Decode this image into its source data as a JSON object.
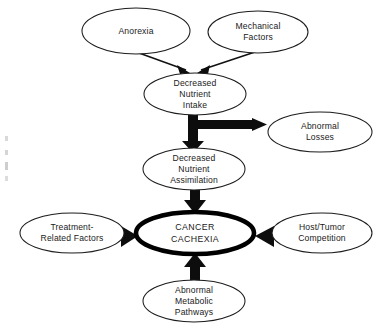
{
  "diagram": {
    "type": "flow-diagram",
    "background_color": "#ffffff",
    "line_color": "#111111",
    "text_color": "#1a1a1a",
    "nodes": [
      {
        "id": "anorexia",
        "lines": [
          "Anorexia"
        ],
        "shape": "ellipse",
        "emphasis": "normal",
        "cx": 136,
        "cy": 31,
        "rx": 54,
        "ry": 23
      },
      {
        "id": "mechanical-factors",
        "lines": [
          "Mechanical",
          "Factors"
        ],
        "shape": "ellipse",
        "emphasis": "normal",
        "cx": 258,
        "cy": 32,
        "rx": 50,
        "ry": 21
      },
      {
        "id": "decreased-nutrient-intake",
        "lines": [
          "Decreased",
          "Nutrient",
          "Intake"
        ],
        "shape": "ellipse",
        "emphasis": "normal",
        "cx": 195,
        "cy": 94,
        "rx": 51,
        "ry": 21
      },
      {
        "id": "abnormal-losses",
        "lines": [
          "Abnormal",
          "Losses"
        ],
        "shape": "ellipse",
        "emphasis": "normal",
        "cx": 320,
        "cy": 132,
        "rx": 52,
        "ry": 20
      },
      {
        "id": "decreased-nutrient-assimilation",
        "lines": [
          "Decreased",
          "Nutrient",
          "Assimilation"
        ],
        "shape": "ellipse",
        "emphasis": "normal",
        "cx": 194,
        "cy": 169,
        "rx": 51,
        "ry": 21
      },
      {
        "id": "treatment-related-factors",
        "lines": [
          "Treatment-",
          "Related Factors"
        ],
        "shape": "ellipse",
        "emphasis": "normal",
        "cx": 72,
        "cy": 233,
        "rx": 52,
        "ry": 20
      },
      {
        "id": "cancer-cachexia",
        "lines": [
          "CANCER",
          "CACHEXIA"
        ],
        "shape": "ellipse",
        "emphasis": "bold",
        "cx": 195,
        "cy": 233,
        "rx": 59,
        "ry": 21
      },
      {
        "id": "host-tumor-competition",
        "lines": [
          "Host/Tumor",
          "Competition"
        ],
        "shape": "ellipse",
        "emphasis": "normal",
        "cx": 322,
        "cy": 233,
        "rx": 50,
        "ry": 20
      },
      {
        "id": "abnormal-metabolic-pathways",
        "lines": [
          "Abnormal",
          "Metabolic",
          "Pathways"
        ],
        "shape": "ellipse",
        "emphasis": "normal",
        "cx": 194,
        "cy": 301,
        "rx": 51,
        "ry": 21
      }
    ],
    "edges": [
      {
        "id": "anorexia-to-intake",
        "from": "anorexia",
        "to": "decreased-nutrient-intake",
        "style": "thin"
      },
      {
        "id": "mechanical-to-intake",
        "from": "mechanical-factors",
        "to": "decreased-nutrient-intake",
        "style": "thin"
      },
      {
        "id": "intake-to-assimilation",
        "from": "decreased-nutrient-intake",
        "to": "decreased-nutrient-assimilation",
        "style": "thick"
      },
      {
        "id": "intake-to-abnormal-losses",
        "from": "decreased-nutrient-intake",
        "to": "abnormal-losses",
        "style": "thick"
      },
      {
        "id": "assimilation-to-cachexia",
        "from": "decreased-nutrient-assimilation",
        "to": "cancer-cachexia",
        "style": "thick"
      },
      {
        "id": "treatment-to-cachexia",
        "from": "treatment-related-factors",
        "to": "cancer-cachexia",
        "style": "thick"
      },
      {
        "id": "host-tumor-to-cachexia",
        "from": "host-tumor-competition",
        "to": "cancer-cachexia",
        "style": "thick"
      },
      {
        "id": "metabolic-to-cachexia",
        "from": "abnormal-metabolic-pathways",
        "to": "cancer-cachexia",
        "style": "thick"
      }
    ]
  }
}
